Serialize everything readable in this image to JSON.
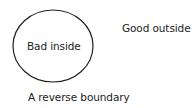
{
  "diagram": {
    "shape": {
      "type": "ellipse",
      "cx": 53,
      "cy": 46,
      "rx": 40,
      "ry": 36,
      "stroke": "#222222",
      "fill": "none"
    },
    "labels": {
      "inside": "Bad inside",
      "outside": "Good outside",
      "caption": "A reverse boundary"
    }
  }
}
